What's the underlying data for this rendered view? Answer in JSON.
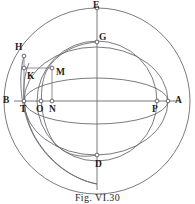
{
  "figure": {
    "caption": "Fig. VI.30",
    "caption_top": 191,
    "title": "Fig. VI.30",
    "width": 195,
    "height": 204,
    "stroke_color": "#6b6b73",
    "label_color": "#1d1d22",
    "background_color": "#ffffff"
  },
  "geometry": {
    "center": {
      "x": 97,
      "y": 101
    },
    "outer_radius": 93,
    "inner_radius": 60,
    "ellipse_semi_minor": 60,
    "left_origin": {
      "x": 24,
      "y": 101
    }
  },
  "points": [
    {
      "id": "E",
      "label": "E",
      "x": 97,
      "y": 8,
      "label_x": 93,
      "label_y": 0,
      "dot": true
    },
    {
      "id": "G",
      "label": "G",
      "x": 97,
      "y": 42,
      "label_x": 99,
      "label_y": 33,
      "dot": true
    },
    {
      "id": "H",
      "label": "H",
      "x": 24,
      "y": 56,
      "label_x": 15,
      "label_y": 43,
      "dot": true
    },
    {
      "id": "K",
      "label": "K",
      "x": 24,
      "y": 68,
      "label_x": 27,
      "label_y": 71,
      "dot": true
    },
    {
      "id": "M",
      "label": "M",
      "x": 52,
      "y": 68,
      "label_x": 56,
      "label_y": 68,
      "dot": true
    },
    {
      "id": "B",
      "label": "B",
      "x": 24,
      "y": 101,
      "label_x": 2,
      "label_y": 96,
      "dot": true
    },
    {
      "id": "T",
      "label": "T",
      "x": 24,
      "y": 101,
      "label_x": 20,
      "label_y": 104,
      "dot": true
    },
    {
      "id": "O",
      "label": "O",
      "x": 41,
      "y": 101,
      "label_x": 36,
      "label_y": 104,
      "dot": true
    },
    {
      "id": "N",
      "label": "N",
      "x": 52,
      "y": 101,
      "label_x": 49,
      "label_y": 104,
      "dot": true
    },
    {
      "id": "P",
      "label": "P",
      "x": 157,
      "y": 101,
      "label_x": 152,
      "label_y": 104,
      "dot": true
    },
    {
      "id": "A",
      "label": "A",
      "x": 168,
      "y": 101,
      "label_x": 174,
      "label_y": 96,
      "dot": true
    },
    {
      "id": "D",
      "label": "D",
      "x": 97,
      "y": 155,
      "label_x": 95,
      "label_y": 159,
      "dot": true
    }
  ],
  "curves": {
    "outer_circle": "Great circle through E, A, D and the left limb",
    "inner_circle": "Circle through G and P centred on O",
    "ellipse_upper": "Ellipse arc B to A through G",
    "ellipse_lower": "Ellipse arc B to A through D",
    "small_arc_left": "Arc from H down through the axis",
    "arc_through_M": "Arc from G through M down to D"
  },
  "segments": {
    "horizontal_axis": "B to A through T, O, N, P",
    "vertical_axis": "E to D through G",
    "rect_km": "K to M horizontal",
    "rect_tk": "T to K vertical",
    "rect_nm": "N to M vertical"
  }
}
